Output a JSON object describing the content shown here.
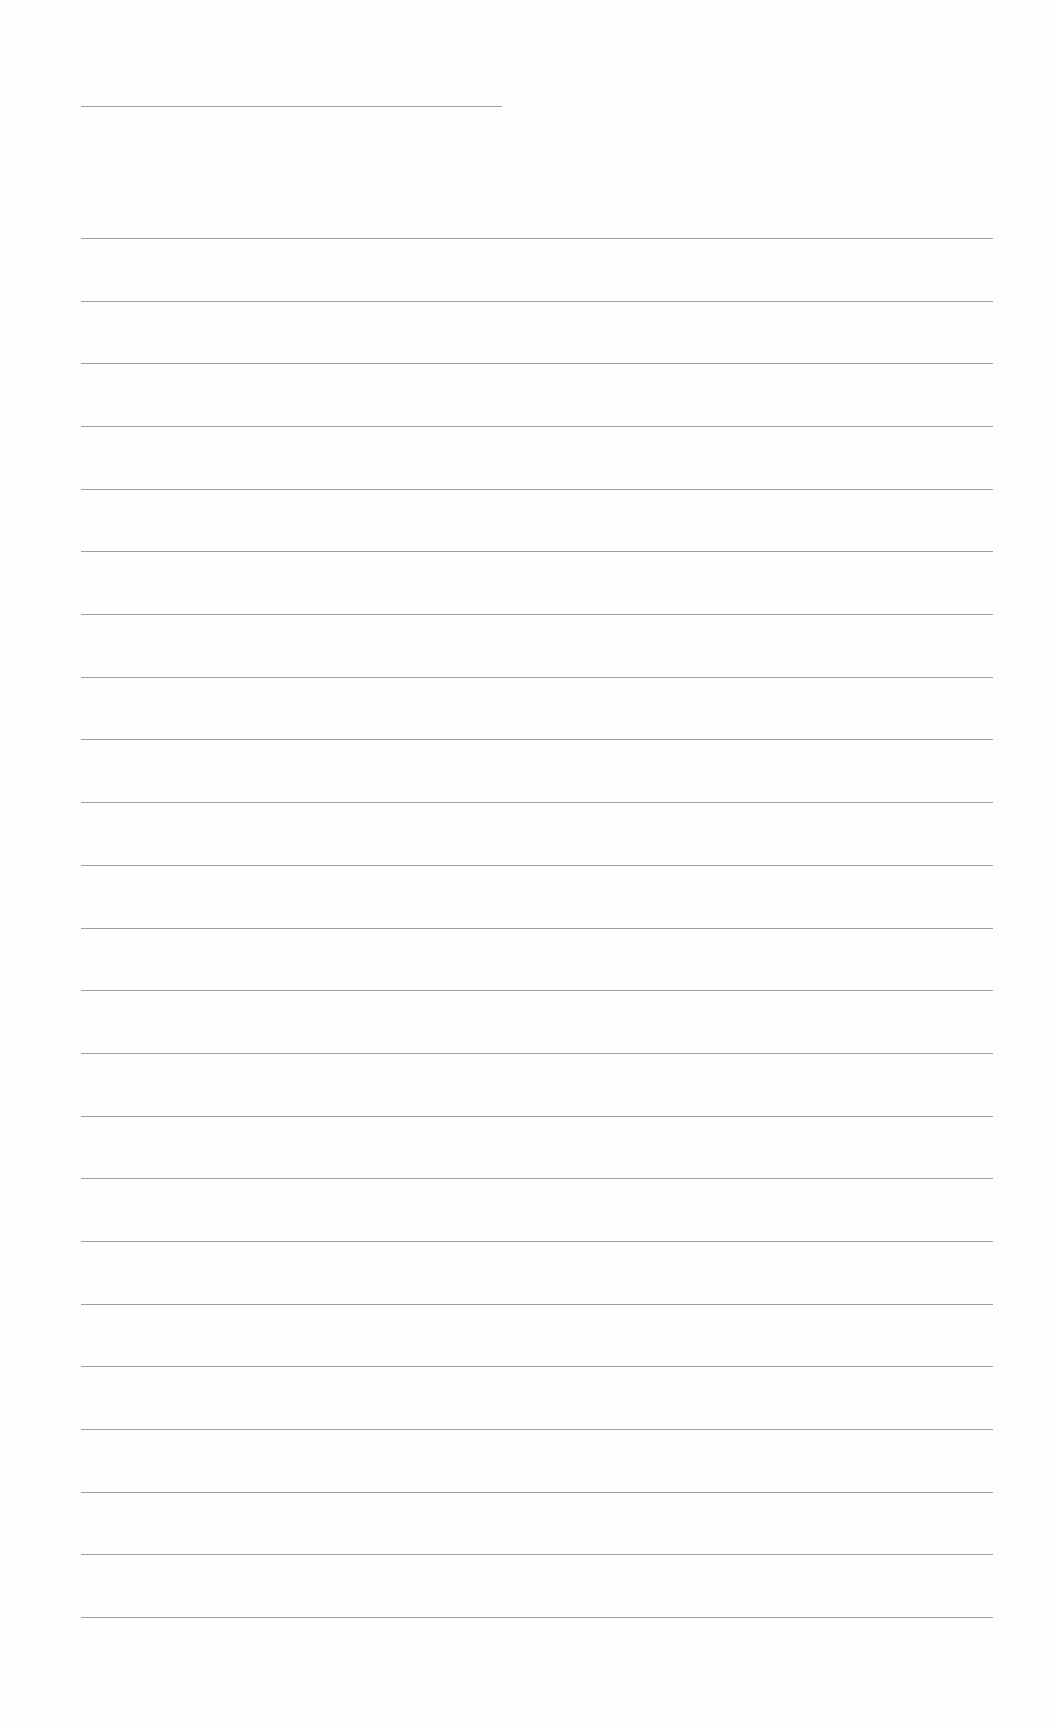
{
  "page": {
    "type": "blank lined sheet",
    "background_color": "#fefefe",
    "line_color": "#8c8c8c"
  },
  "header_line": {
    "y": 106,
    "x_start": 81,
    "x_end": 502
  },
  "ruled_lines": {
    "count": 23,
    "x_start": 81,
    "x_end": 993,
    "first_y": 238,
    "last_y": 1617
  }
}
